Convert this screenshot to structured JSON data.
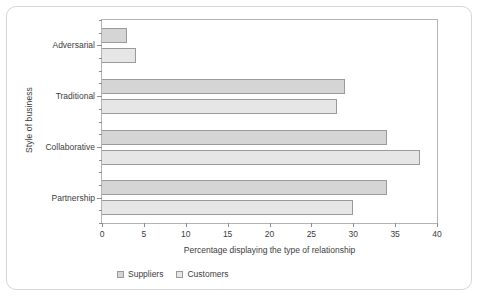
{
  "chart_data": {
    "type": "bar",
    "orientation": "horizontal",
    "title": "",
    "xlabel": "Percentage displaying the type of relationship",
    "ylabel": "Style of business",
    "categories": [
      "Adversarial",
      "Traditional",
      "Collaborative",
      "Partnership"
    ],
    "series": [
      {
        "name": "Suppliers",
        "values": [
          3,
          29,
          34,
          34
        ],
        "color": "#d5d5d5"
      },
      {
        "name": "Customers",
        "values": [
          4,
          28,
          38,
          30
        ],
        "color": "#e6e6e6"
      }
    ],
    "xlim": [
      0,
      40
    ],
    "xticks": [
      0,
      5,
      10,
      15,
      20,
      25,
      30,
      35,
      40
    ],
    "xticklabels": [
      "0",
      "5",
      "10",
      "15",
      "20",
      "25",
      "30",
      "35",
      "40"
    ],
    "grid": false,
    "legend_position": "bottom-left",
    "legend_entries": [
      "Suppliers",
      "Customers"
    ]
  }
}
